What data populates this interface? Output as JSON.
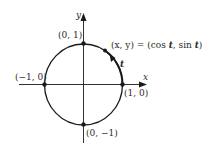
{
  "diagram": {
    "axes": {
      "x_label": "x",
      "y_label": "y"
    },
    "points": [
      {
        "id": "top",
        "label": "(0, 1)"
      },
      {
        "id": "left",
        "label": "(−1, 0)"
      },
      {
        "id": "right",
        "label": "(1, 0)"
      },
      {
        "id": "bottom",
        "label": "(0, −1)"
      }
    ],
    "moving_point": {
      "label_lhs": "(x, y) = (cos ",
      "t1": "t",
      "label_mid": ", sin ",
      "t2": "t",
      "label_end": ")"
    },
    "arc_parameter_label": "t",
    "colors": {
      "stroke": "#1a1a1a",
      "text": "#2a2a2a",
      "background": "#ffffff"
    }
  }
}
